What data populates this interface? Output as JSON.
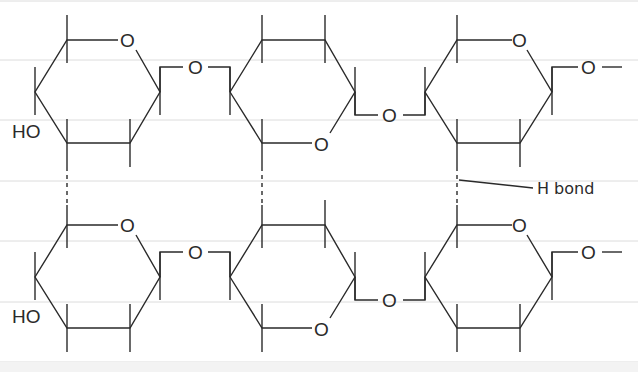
{
  "colors": {
    "ink": "#2a2a2a",
    "grid": "#dcdcdc",
    "background": "#ffffff"
  },
  "atoms": {
    "oxygen": "O",
    "hydroxyl": "HO"
  },
  "annotations": {
    "h_bond": "H bond"
  },
  "chains": [
    {
      "name": "upper-chain",
      "rings": 3,
      "terminal_group": "HO",
      "end_group": "O"
    },
    {
      "name": "lower-chain",
      "rings": 3,
      "terminal_group": "HO",
      "end_group": "O"
    }
  ]
}
